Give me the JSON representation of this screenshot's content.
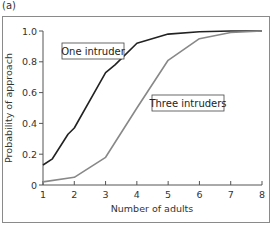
{
  "panel_label": "(a)",
  "chart_data": {
    "type": "line",
    "title": "",
    "xlabel": "Number of adults",
    "ylabel": "Probability of approach",
    "xlim": [
      1,
      8
    ],
    "ylim": [
      0,
      1.0
    ],
    "grid": false,
    "xticks": [
      "1",
      "2",
      "3",
      "4",
      "5",
      "6",
      "7",
      "8"
    ],
    "yticks": [
      "0",
      "0.2",
      "0.4",
      "0.6",
      "0.8",
      "1.0"
    ],
    "legend_position": "inline labels",
    "series": [
      {
        "name": "One intruder",
        "color": "#222222",
        "x": [
          1,
          1.3,
          1.8,
          2,
          3,
          3.3,
          4,
          5,
          6,
          7,
          8
        ],
        "values": [
          0.13,
          0.17,
          0.33,
          0.37,
          0.73,
          0.78,
          0.92,
          0.98,
          0.995,
          1.0,
          1.0
        ]
      },
      {
        "name": "Three intruders",
        "color": "#888888",
        "x": [
          1,
          2,
          3,
          4,
          5,
          6,
          7,
          8
        ],
        "values": [
          0.02,
          0.05,
          0.18,
          0.5,
          0.81,
          0.95,
          0.99,
          1.0
        ]
      }
    ]
  }
}
